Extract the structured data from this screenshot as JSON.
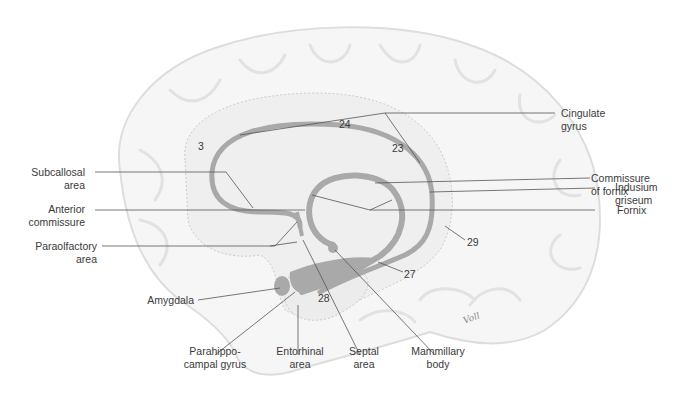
{
  "figure": {
    "signature": "Voll"
  },
  "labels": {
    "cingulate_gyrus": [
      "Cingulate",
      "gyrus"
    ],
    "commissure_of_fornix": [
      "Commissure",
      "of fornix"
    ],
    "indusium_griseum": [
      "Indusium",
      "griseum"
    ],
    "fornix": [
      "Fornix"
    ],
    "subcallosal_area": [
      "Subcallosal",
      "area"
    ],
    "anterior_commissure": [
      "Anterior",
      "commissure"
    ],
    "paraolfactory_area": [
      "Paraolfactory",
      "area"
    ],
    "amygdala": [
      "Amygdala"
    ],
    "parahippocampal_gyrus": [
      "Parahippo-",
      "campal gyrus"
    ],
    "entorhinal_area": [
      "Entorhinal",
      "area"
    ],
    "septal_area": [
      "Septal",
      "area"
    ],
    "mammillary_body": [
      "Mammillary",
      "body"
    ]
  },
  "brodmann_areas": {
    "a3": "3",
    "a24": "24",
    "a23": "23",
    "a29": "29",
    "a27": "27",
    "a28": "28"
  },
  "colors": {
    "structure_gray": "#a9a9a9",
    "region_fill": "#eeeeee",
    "leader_line": "#555555",
    "text": "#3a3a3a"
  }
}
